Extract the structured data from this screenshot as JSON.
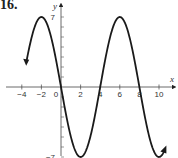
{
  "problem_number": "16.",
  "chart_data": {
    "type": "line",
    "title": "",
    "xlabel": "x",
    "ylabel": "y",
    "x_ticks": [
      -4,
      -2,
      0,
      2,
      4,
      6,
      8,
      10
    ],
    "x_tick_labels": [
      "-4",
      "-2",
      "0",
      "2",
      "4",
      "6",
      "8",
      "10"
    ],
    "y_tick_labels": [
      "7",
      "-7"
    ],
    "y_ticks": [
      7,
      -7
    ],
    "xlim": [
      -4.5,
      11
    ],
    "ylim": [
      -7,
      7
    ],
    "function": "y = -7 sin(pi*x/4)",
    "amplitude": 7,
    "period": 8,
    "series": [
      {
        "name": "curve",
        "x": [
          -3.5,
          -3,
          -2,
          -1,
          0,
          1,
          2,
          3,
          4,
          5,
          6,
          7,
          8,
          9,
          10,
          10.5
        ],
        "values": [
          -2.7,
          4.9,
          7,
          4.9,
          0,
          -4.9,
          -7,
          -4.9,
          0,
          4.9,
          7,
          4.9,
          0,
          -4.9,
          -7,
          -6.5
        ]
      }
    ],
    "grid": false,
    "legend": "none"
  }
}
